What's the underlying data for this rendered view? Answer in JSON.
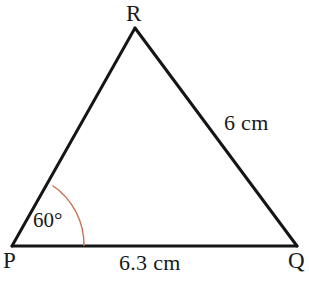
{
  "figure": {
    "type": "triangle-geometry-diagram",
    "background_color": "#ffffff",
    "stroke_color": "#151515",
    "stroke_width": 3,
    "arc_color": "#c8704f",
    "arc_width": 1.4,
    "vertices": [
      {
        "name": "P",
        "label": "P",
        "x": 12,
        "y": 246
      },
      {
        "name": "Q",
        "label": "Q",
        "x": 297,
        "y": 246
      },
      {
        "name": "R",
        "label": "R",
        "x": 135,
        "y": 28
      }
    ],
    "sides": [
      {
        "name": "PQ",
        "label": "6.3 cm",
        "from": "P",
        "to": "Q"
      },
      {
        "name": "RQ",
        "label": "6 cm",
        "from": "R",
        "to": "Q"
      },
      {
        "name": "PR",
        "label": "",
        "from": "P",
        "to": "R"
      }
    ],
    "angles": [
      {
        "at": "P",
        "label": "60°",
        "value": 60,
        "unit": "degree",
        "arc_radius": 72
      }
    ]
  },
  "labels": {
    "vertex_r": "R",
    "vertex_p": "P",
    "vertex_q": "Q",
    "side_rq": "6 cm",
    "side_pq": "6.3 cm",
    "angle_p": "60°"
  }
}
